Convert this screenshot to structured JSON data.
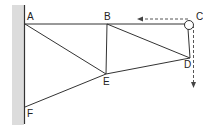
{
  "diagram": {
    "type": "truss-frame",
    "nodes": [
      {
        "id": "A",
        "label": "A",
        "x": 25,
        "y": 24
      },
      {
        "id": "B",
        "label": "B",
        "x": 107,
        "y": 24
      },
      {
        "id": "C",
        "label": "C",
        "x": 189,
        "y": 24
      },
      {
        "id": "D",
        "label": "D",
        "x": 190,
        "y": 58
      },
      {
        "id": "E",
        "label": "E",
        "x": 106,
        "y": 74
      },
      {
        "id": "F",
        "label": "F",
        "x": 25,
        "y": 107
      }
    ],
    "members": [
      [
        "A",
        "B"
      ],
      [
        "B",
        "C"
      ],
      [
        "A",
        "E"
      ],
      [
        "B",
        "E"
      ],
      [
        "B",
        "D"
      ],
      [
        "C",
        "D"
      ],
      [
        "E",
        "D"
      ],
      [
        "F",
        "E"
      ]
    ],
    "support": "wall (left)",
    "pulley": "C",
    "arrows": [
      {
        "from": "C",
        "direction": "left",
        "style": "dashed"
      },
      {
        "from": "C",
        "direction": "down",
        "style": "dashed"
      }
    ],
    "colors": {
      "line": "#333333",
      "wall": "#d9d9d9",
      "dashed": "#555555"
    }
  }
}
